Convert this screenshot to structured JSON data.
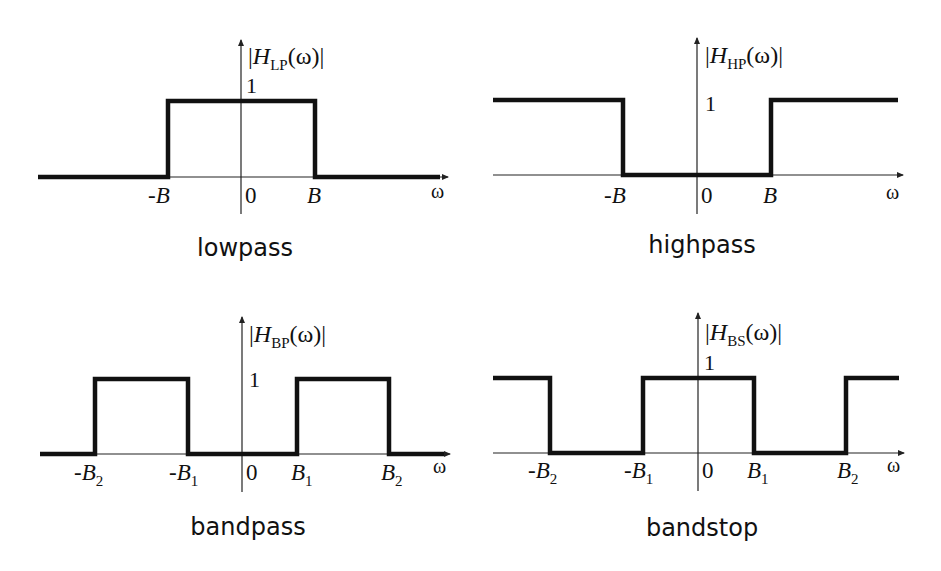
{
  "panels": [
    {
      "id": "lowpass",
      "caption": "lowpass",
      "ylabel_main": "H",
      "ylabel_sub": "LP",
      "ylabel_arg": "(ω)",
      "xlabel": "ω",
      "one_label": "1",
      "ticks": [
        {
          "main": "-B",
          "sub": ""
        },
        {
          "main": "0",
          "sub": ""
        },
        {
          "main": "B",
          "sub": ""
        }
      ]
    },
    {
      "id": "highpass",
      "caption": "highpass",
      "ylabel_main": "H",
      "ylabel_sub": "HP",
      "ylabel_arg": "(ω)",
      "xlabel": "ω",
      "one_label": "1",
      "ticks": [
        {
          "main": "-B",
          "sub": ""
        },
        {
          "main": "0",
          "sub": ""
        },
        {
          "main": "B",
          "sub": ""
        }
      ]
    },
    {
      "id": "bandpass",
      "caption": "bandpass",
      "ylabel_main": "H",
      "ylabel_sub": "BP",
      "ylabel_arg": "(ω)",
      "xlabel": "ω",
      "one_label": "1",
      "ticks": [
        {
          "main": "-B",
          "sub": "2"
        },
        {
          "main": "-B",
          "sub": "1"
        },
        {
          "main": "0",
          "sub": ""
        },
        {
          "main": "B",
          "sub": "1"
        },
        {
          "main": "B",
          "sub": "2"
        }
      ]
    },
    {
      "id": "bandstop",
      "caption": "bandstop",
      "ylabel_main": "H",
      "ylabel_sub": "BS",
      "ylabel_arg": "(ω)",
      "xlabel": "ω",
      "one_label": "1",
      "ticks": [
        {
          "main": "-B",
          "sub": "2"
        },
        {
          "main": "-B",
          "sub": "1"
        },
        {
          "main": "0",
          "sub": ""
        },
        {
          "main": "B",
          "sub": "1"
        },
        {
          "main": "B",
          "sub": "2"
        }
      ]
    }
  ],
  "colors": {
    "line": "#111111",
    "background": "#ffffff"
  }
}
